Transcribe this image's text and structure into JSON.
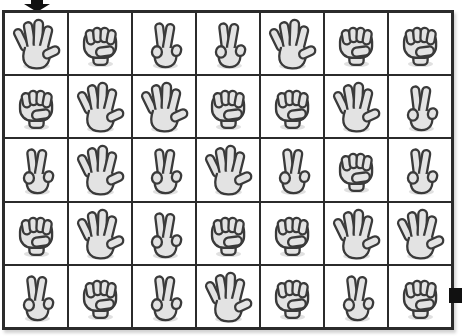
{
  "puzzle": {
    "type": "hand-gesture-grid",
    "columns": 7,
    "rows": 5,
    "start_marker": "black-down-arrow-above-column-1",
    "end_marker": "black-square-right-of-last-row",
    "gesture_legend": {
      "paper": "open hand, five digits spread",
      "rock": "closed fist",
      "scissors": "two fingers up (peace sign)"
    },
    "cells": [
      [
        "paper",
        "rock",
        "scissors",
        "scissors",
        "paper",
        "rock",
        "rock"
      ],
      [
        "rock",
        "paper",
        "paper",
        "rock",
        "rock",
        "paper",
        "scissors"
      ],
      [
        "scissors",
        "paper",
        "scissors",
        "paper",
        "scissors",
        "rock",
        "scissors"
      ],
      [
        "rock",
        "paper",
        "scissors",
        "rock",
        "rock",
        "paper",
        "paper"
      ],
      [
        "scissors",
        "rock",
        "scissors",
        "paper",
        "rock",
        "scissors",
        "rock"
      ]
    ],
    "colors": {
      "hand_fill": "#e3e3e3",
      "hand_outline": "#3a3a3a",
      "grid_border": "#2b2b2b",
      "marker_black": "#111111",
      "hand_shadow": "#d6d6d6",
      "background": "#ffffff"
    }
  }
}
